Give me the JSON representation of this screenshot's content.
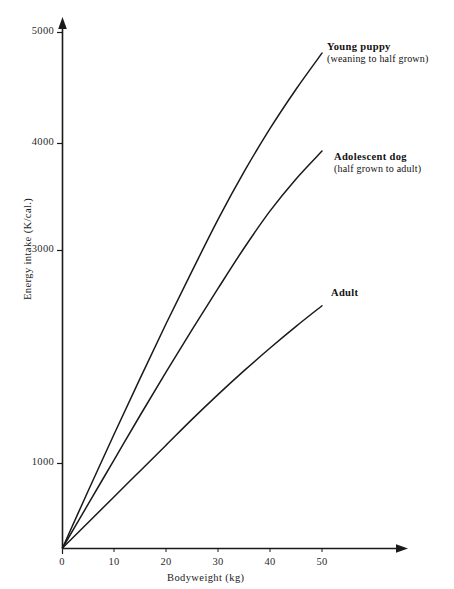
{
  "chart_data": {
    "type": "line",
    "title": "",
    "xlabel": "Bodyweight (kg)",
    "ylabel": "Energy intake  (K/cal.)",
    "xlim": [
      0,
      65
    ],
    "ylim": [
      0,
      5200
    ],
    "grid": false,
    "legend_position": "inline-right-of-line-ends",
    "xticks": [
      "0",
      "10",
      "20",
      "30",
      "40",
      "50"
    ],
    "xtick_values": [
      0,
      10,
      20,
      30,
      40,
      50
    ],
    "yticks": [
      "1000",
      "3000",
      "4000",
      "5000"
    ],
    "ytick_values": [
      1000,
      3000,
      4000,
      5000
    ],
    "x": [
      0,
      5,
      10,
      15,
      20,
      25,
      30,
      35,
      40,
      45,
      50
    ],
    "series": [
      {
        "name": "Young puppy",
        "sublabel": "(weaning to half grown)",
        "color": "#1a1a1a",
        "values": [
          0,
          560,
          1110,
          1650,
          2180,
          2690,
          3190,
          3650,
          4070,
          4450,
          4800
        ]
      },
      {
        "name": "Adolescent dog",
        "sublabel": "(half grown to adult)",
        "color": "#1a1a1a",
        "values": [
          0,
          430,
          860,
          1290,
          1710,
          2120,
          2520,
          2910,
          3270,
          3580,
          3850
        ]
      },
      {
        "name": "Adult",
        "sublabel": "",
        "color": "#1a1a1a",
        "values": [
          0,
          250,
          500,
          750,
          1000,
          1250,
          1490,
          1720,
          1940,
          2150,
          2350
        ]
      }
    ]
  },
  "axes": {
    "x_label": "Bodyweight (kg)",
    "y_label": "Energy intake  (K/cal.)",
    "x_tick_labels": [
      "0",
      "10",
      "20",
      "30",
      "40",
      "50"
    ],
    "y_tick_labels": [
      "5000",
      "4000",
      "3000",
      "1000"
    ]
  },
  "legend": {
    "puppy_title": "Young puppy",
    "puppy_sub": "(weaning to half grown)",
    "adolescent_title": "Adolescent dog",
    "adolescent_sub": "(half grown to adult)",
    "adult_title": "Adult"
  },
  "style": {
    "line_color": "#1a1a1a",
    "axis_color": "#1a1a1a",
    "text_color": "#1a1a1a",
    "background": "#ffffff"
  }
}
